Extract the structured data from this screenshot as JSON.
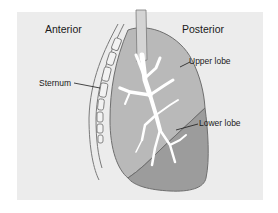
{
  "diagram": {
    "headings": {
      "anterior": "Anterior",
      "posterior": "Posterior"
    },
    "callouts": {
      "sternum": "Sternum",
      "upper_lobe": "Upper lobe",
      "lower_lobe": "Lower lobe"
    },
    "colors": {
      "background_panel": "#ececec",
      "upper_lobe_fill": "#b9b9b9",
      "lower_lobe_fill": "#9c9c9c",
      "outline": "#6e6e6e",
      "bronchi": "#ffffff",
      "chest_wall_line": "#7a7a7a"
    }
  }
}
